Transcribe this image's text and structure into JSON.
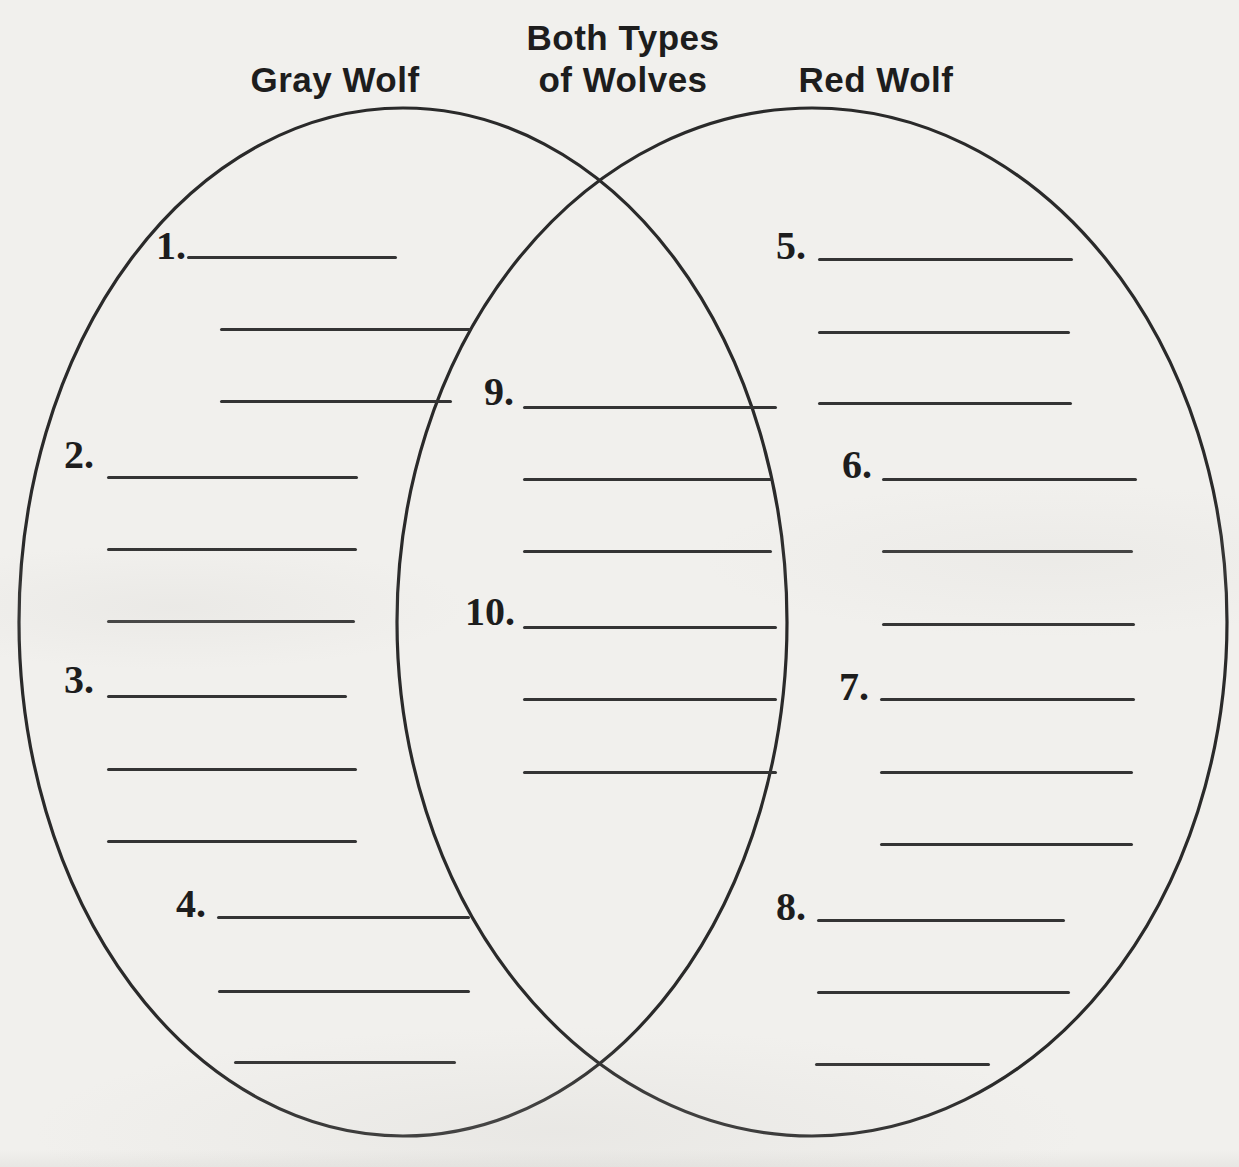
{
  "worksheet": {
    "venn": {
      "left_label": "Gray Wolf",
      "center_label": {
        "line1": "Both Types",
        "line2": "of Wolves"
      },
      "right_label": "Red Wolf"
    },
    "item_numbers": [
      "1.",
      "2.",
      "3.",
      "4.",
      "5.",
      "6.",
      "7.",
      "8.",
      "9.",
      "10."
    ],
    "structure": {
      "gray_wolf_item_numbers": [
        "1.",
        "2.",
        "3.",
        "4."
      ],
      "red_wolf_item_numbers": [
        "5.",
        "6.",
        "7.",
        "8."
      ],
      "both_item_numbers": [
        "9.",
        "10."
      ],
      "blank_lines_per_item": 3,
      "all_lines_blank": true
    },
    "colors": {
      "paper": "#f1f0ed",
      "ink": "#1d1d1d",
      "blank_line": "#343434"
    }
  }
}
